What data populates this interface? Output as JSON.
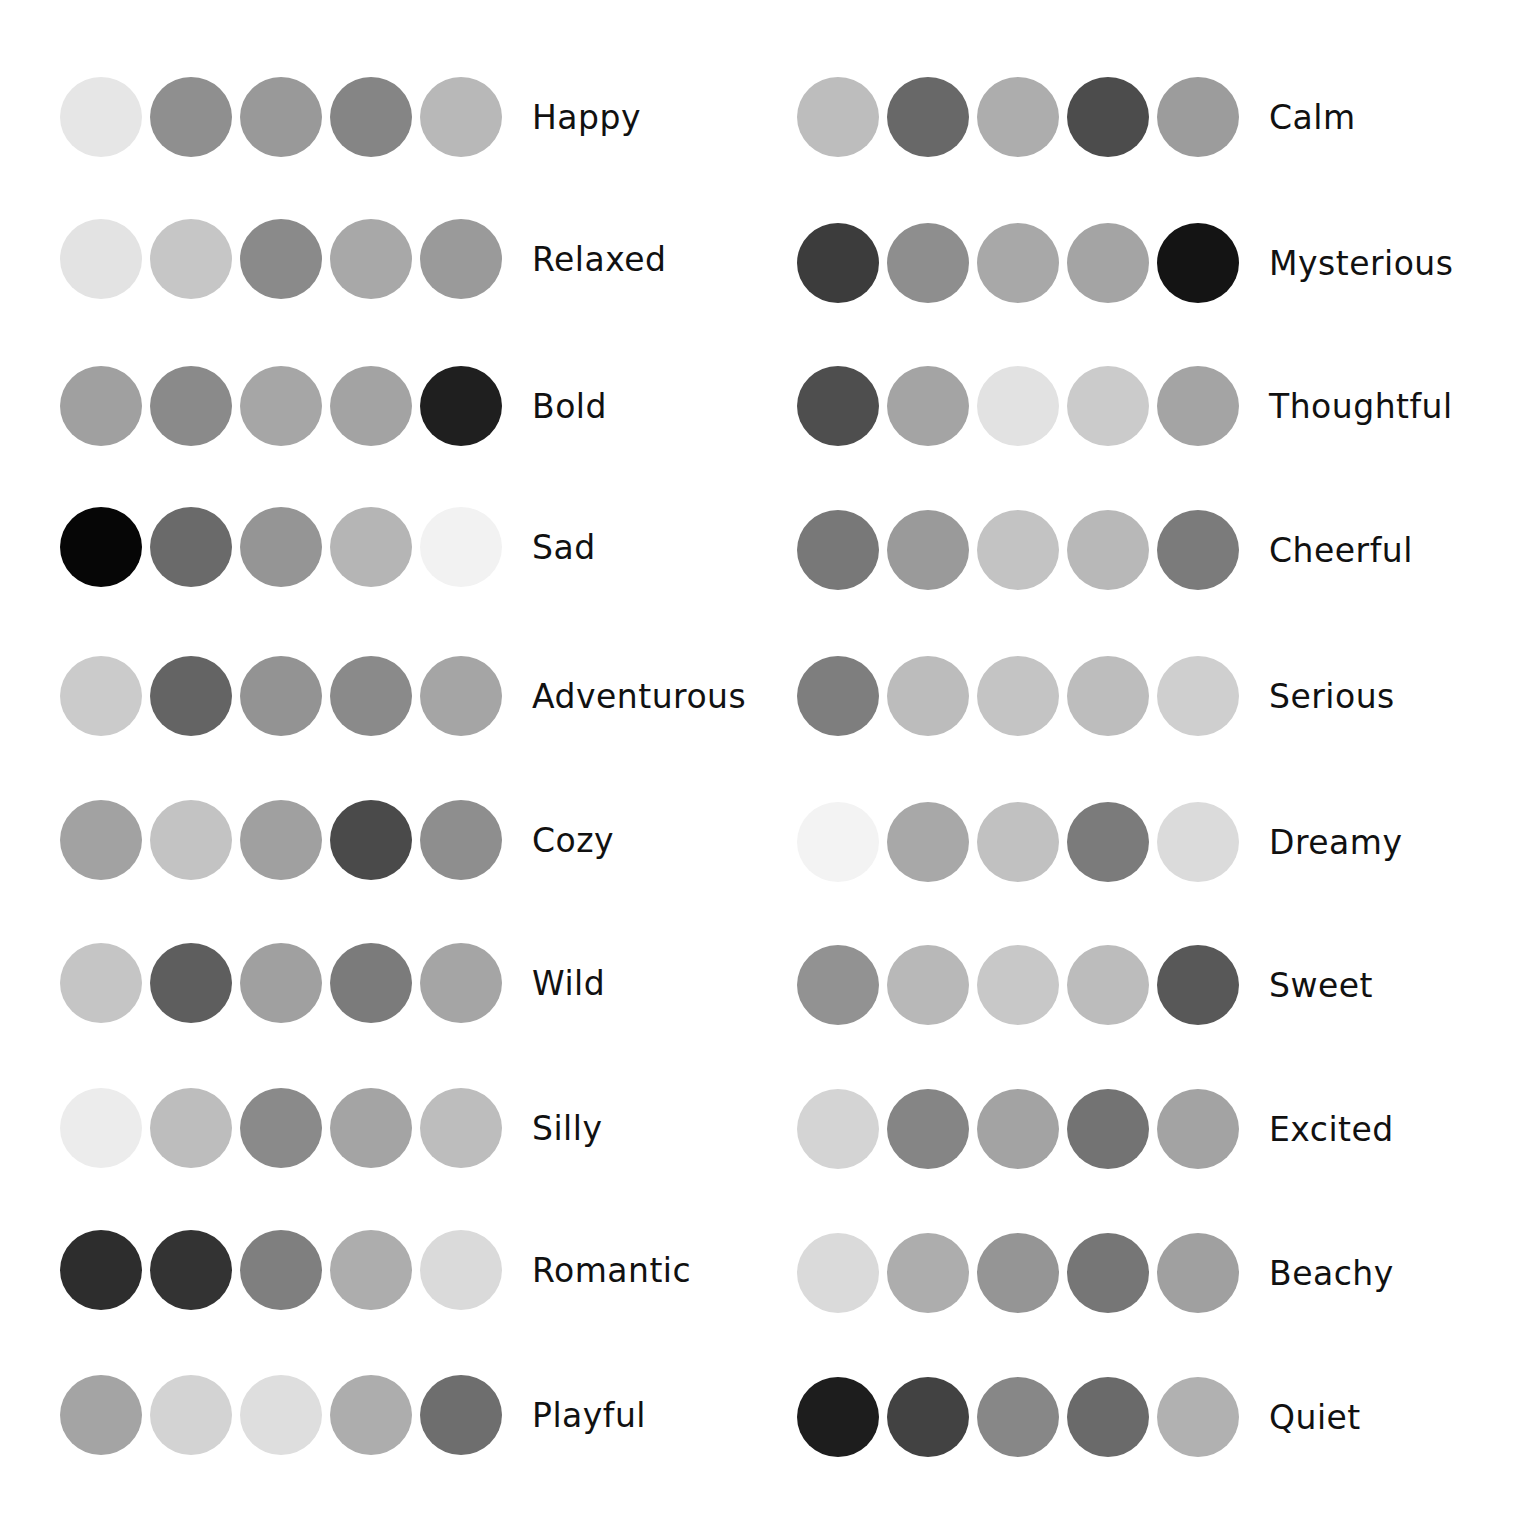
{
  "palettes_left": [
    {
      "label": "Happy",
      "top": 76,
      "colors": [
        "#e6e6e6",
        "#8f8f8f",
        "#999999",
        "#858585",
        "#b8b8b8"
      ]
    },
    {
      "label": "Relaxed",
      "top": 218,
      "colors": [
        "#e3e3e3",
        "#c6c6c6",
        "#8a8a8a",
        "#a8a8a8",
        "#9a9a9a"
      ]
    },
    {
      "label": "Bold",
      "top": 365,
      "colors": [
        "#a0a0a0",
        "#8a8a8a",
        "#a6a6a6",
        "#a3a3a3",
        "#1f1f1f"
      ]
    },
    {
      "label": "Sad",
      "top": 506,
      "colors": [
        "#060606",
        "#6a6a6a",
        "#959595",
        "#b5b5b5",
        "#f2f2f2"
      ]
    },
    {
      "label": "Adventurous",
      "top": 655,
      "colors": [
        "#cbcbcb",
        "#646464",
        "#939393",
        "#8a8a8a",
        "#a5a5a5"
      ]
    },
    {
      "label": "Cozy",
      "top": 799,
      "colors": [
        "#a2a2a2",
        "#c3c3c3",
        "#a0a0a0",
        "#4a4a4a",
        "#8e8e8e"
      ]
    },
    {
      "label": "Wild",
      "top": 942,
      "colors": [
        "#c5c5c5",
        "#5e5e5e",
        "#a0a0a0",
        "#7b7b7b",
        "#a5a5a5"
      ]
    },
    {
      "label": "Silly",
      "top": 1087,
      "colors": [
        "#ececec",
        "#bdbdbd",
        "#8a8a8a",
        "#a4a4a4",
        "#bdbdbd"
      ]
    },
    {
      "label": "Romantic",
      "top": 1229,
      "colors": [
        "#2d2d2d",
        "#333333",
        "#7f7f7f",
        "#adadad",
        "#dadada"
      ]
    },
    {
      "label": "Playful",
      "top": 1374,
      "colors": [
        "#a4a4a4",
        "#d3d3d3",
        "#dedede",
        "#adadad",
        "#6e6e6e"
      ]
    }
  ],
  "palettes_right": [
    {
      "label": "Calm",
      "top": 76,
      "colors": [
        "#bdbdbd",
        "#686868",
        "#adadad",
        "#4c4c4c",
        "#9c9c9c"
      ]
    },
    {
      "label": "Mysterious",
      "top": 222,
      "colors": [
        "#3c3c3c",
        "#8e8e8e",
        "#a8a8a8",
        "#a4a4a4",
        "#141414"
      ]
    },
    {
      "label": "Thoughtful",
      "top": 365,
      "colors": [
        "#4e4e4e",
        "#a4a4a4",
        "#e2e2e2",
        "#cbcbcb",
        "#a4a4a4"
      ]
    },
    {
      "label": "Cheerful",
      "top": 509,
      "colors": [
        "#787878",
        "#9a9a9a",
        "#c3c3c3",
        "#b8b8b8",
        "#7b7b7b"
      ]
    },
    {
      "label": "Serious",
      "top": 655,
      "colors": [
        "#7e7e7e",
        "#bcbcbc",
        "#c4c4c4",
        "#bdbdbd",
        "#cfcfcf"
      ]
    },
    {
      "label": "Dreamy",
      "top": 801,
      "colors": [
        "#f3f3f3",
        "#a8a8a8",
        "#c1c1c1",
        "#7b7b7b",
        "#dbdbdb"
      ]
    },
    {
      "label": "Sweet",
      "top": 944,
      "colors": [
        "#929292",
        "#b8b8b8",
        "#c8c8c8",
        "#bcbcbc",
        "#585858"
      ]
    },
    {
      "label": "Excited",
      "top": 1088,
      "colors": [
        "#d4d4d4",
        "#858585",
        "#a3a3a3",
        "#737373",
        "#a3a3a3"
      ]
    },
    {
      "label": "Beachy",
      "top": 1232,
      "colors": [
        "#dadada",
        "#adadad",
        "#959595",
        "#767676",
        "#a0a0a0"
      ]
    },
    {
      "label": "Quiet",
      "top": 1376,
      "colors": [
        "#1d1d1d",
        "#424242",
        "#878787",
        "#6a6a6a",
        "#b1b1b1"
      ]
    }
  ]
}
